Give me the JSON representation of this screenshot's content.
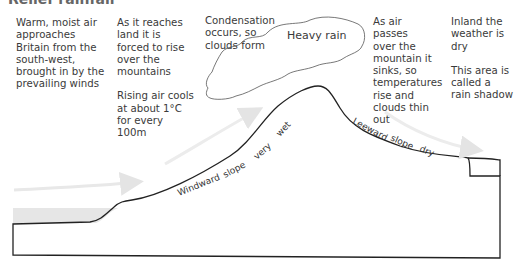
{
  "diagram": {
    "title": "Relief rainfall",
    "annotations": {
      "approach": "Warm, moist air approaches Britain from the south-west, brought in by the prevailing winds",
      "rise": "As it reaches land it is forced to rise over the mountains",
      "cooling": "Rising air cools at about 1°C for every 100m",
      "condensation": "Condensation occurs, so clouds form",
      "cloud": "Heavy rain",
      "sinking": "As air passes over the mountain it sinks, so temperatures rise and clouds thin out",
      "inland": "Inland the weather is dry",
      "shadow": "This area is called a rain shadow"
    },
    "slope_labels": {
      "windward": [
        "Windward",
        "slope",
        "very",
        "wet"
      ],
      "leeward": [
        "Leeward",
        "slope",
        "dry"
      ]
    },
    "colors": {
      "outline": "#222222",
      "sea": "#e6e6e6",
      "arrow": "#e8e8e8",
      "cloud_stroke": "#555555"
    }
  }
}
